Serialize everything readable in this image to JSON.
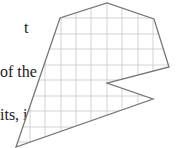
{
  "text_fragments": {
    "line1": "t",
    "line2": "of the",
    "line3": "its, if"
  },
  "figure": {
    "grid": {
      "spacing": 15.3,
      "x_lines": [
        30,
        45,
        61,
        76,
        91,
        107,
        122,
        138,
        153
      ],
      "y_lines": [
        18,
        34,
        49,
        65,
        80,
        96,
        111,
        127,
        142
      ],
      "color": "#c8c8c8"
    },
    "polygon": {
      "points": [
        [
          16,
          147
        ],
        [
          60,
          18
        ],
        [
          107,
          3
        ],
        [
          154,
          19
        ],
        [
          169,
          67
        ],
        [
          107,
          83
        ],
        [
          153,
          99
        ]
      ],
      "stroke": "#777777",
      "fill": "#ffffff"
    }
  }
}
